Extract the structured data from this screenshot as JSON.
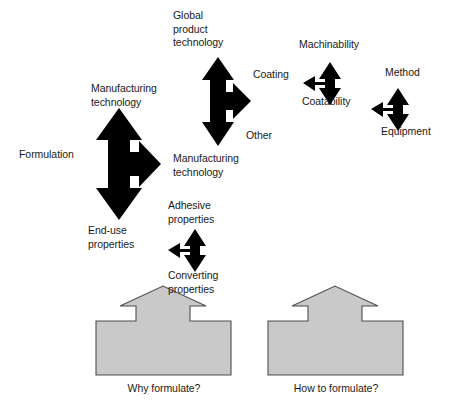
{
  "figure": {
    "colors": {
      "arrow_fill": "#000000",
      "block_fill": "#c9c9c9",
      "block_stroke": "#4d4d4d",
      "text": "#1a1a1a",
      "background": "#ffffff"
    }
  },
  "labels": {
    "formulation": "Formulation",
    "manufacturing_technology_left_top": "Manufacturing\ntechnology",
    "end_use_properties": "End-use\nproperties",
    "global_product_technology": "Global\nproduct\ntechnology",
    "manufacturing_technology_center_bottom": "Manufacturing\ntechnology",
    "coating": "Coating",
    "other": "Other",
    "machinability": "Machinability",
    "coatability": "Coatability",
    "method": "Method",
    "equipment": "Equipment",
    "adhesive_properties": "Adhesive\nproperties",
    "converting_properties": "Converting\nproperties",
    "why_formulate": "Why formulate?",
    "how_to_formulate": "How to formulate?"
  },
  "arrows": [
    {
      "name": "formulation-tri-arrow",
      "directions": [
        "up",
        "down",
        "right"
      ],
      "up_label": "Manufacturing technology",
      "down_label": "End-use properties",
      "right_label": "Manufacturing technology",
      "side_label": "Formulation"
    },
    {
      "name": "manufacturing-technology-tri-arrow",
      "directions": [
        "up",
        "down",
        "right"
      ],
      "up_label": "Global product technology",
      "down_label": "Manufacturing technology",
      "right_label": "Coating / Other"
    },
    {
      "name": "coating-tri-arrow",
      "directions": [
        "up",
        "down",
        "left"
      ],
      "up_label": "Machinability",
      "down_label": "Coatability",
      "left_label": "Coating"
    },
    {
      "name": "method-equipment-tri-arrow",
      "directions": [
        "up",
        "down",
        "left"
      ],
      "up_label": "Method",
      "down_label": "Equipment"
    },
    {
      "name": "adhesive-converting-tri-arrow",
      "directions": [
        "up",
        "down",
        "left"
      ],
      "up_label": "Adhesive properties",
      "down_label": "Converting properties",
      "left_label": "End-use properties"
    }
  ],
  "blocks": [
    {
      "name": "why-formulate-block",
      "label": "Why formulate?"
    },
    {
      "name": "how-to-formulate-block",
      "label": "How to formulate?"
    }
  ]
}
